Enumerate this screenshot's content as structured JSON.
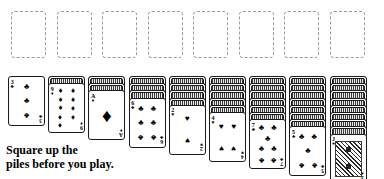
{
  "app": {
    "title": "Spider Solitaire Deal Layout"
  },
  "foundations": {
    "name": "empty-foundation-slots",
    "count": 8,
    "style": "dashed-outline",
    "border_color": "#9a9a9a",
    "slots": [
      {
        "label": ""
      },
      {
        "label": ""
      },
      {
        "label": ""
      },
      {
        "label": ""
      },
      {
        "label": ""
      },
      {
        "label": ""
      },
      {
        "label": ""
      },
      {
        "label": ""
      }
    ]
  },
  "tableau": {
    "pile_count": 9,
    "piles": [
      {
        "index": 1,
        "facedown_count": 0,
        "face_up": {
          "rank": "3",
          "suit": "clubs",
          "suit_glyph": "♣",
          "color": "#000000",
          "pip_count": 3
        }
      },
      {
        "index": 2,
        "facedown_count": 1,
        "face_up": {
          "rank": "9",
          "suit": "diamonds",
          "suit_glyph": "♦",
          "color": "#000000",
          "pip_count": 9
        }
      },
      {
        "index": 3,
        "facedown_count": 2,
        "face_up": {
          "rank": "A",
          "suit": "diamonds",
          "suit_glyph": "♦",
          "color": "#000000",
          "pip_count": 1
        }
      },
      {
        "index": 4,
        "facedown_count": 3,
        "face_up": {
          "rank": "6",
          "suit": "clubs",
          "suit_glyph": "♣",
          "color": "#000000",
          "pip_count": 6
        }
      },
      {
        "index": 5,
        "facedown_count": 4,
        "face_up": {
          "rank": "2",
          "suit": "hearts",
          "suit_glyph": "♥",
          "color": "#000000",
          "pip_count": 2
        }
      },
      {
        "index": 6,
        "facedown_count": 5,
        "face_up": {
          "rank": "4",
          "suit": "hearts",
          "suit_glyph": "♥",
          "color": "#000000",
          "pip_count": 4
        }
      },
      {
        "index": 7,
        "facedown_count": 6,
        "face_up": {
          "rank": "7",
          "suit": "clubs",
          "suit_glyph": "♣",
          "color": "#000000",
          "pip_count": 7
        }
      },
      {
        "index": 8,
        "facedown_count": 7,
        "face_up": {
          "rank": "5",
          "suit": "clubs",
          "suit_glyph": "♣",
          "color": "#000000",
          "pip_count": 5
        }
      },
      {
        "index": 9,
        "facedown_count": 8,
        "face_up": {
          "rank": "J",
          "suit": "spades",
          "suit_glyph": "♠",
          "color": "#000000",
          "pip_count": 0,
          "court": true
        }
      }
    ]
  },
  "caption": {
    "line1": "Square up the",
    "line2": "piles before you play."
  }
}
